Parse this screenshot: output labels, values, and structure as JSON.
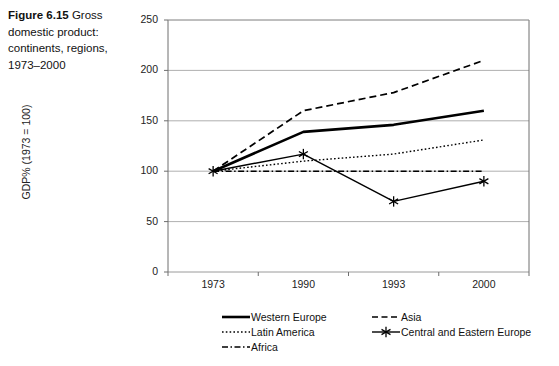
{
  "caption": {
    "label": "Figure 6.15",
    "text": " Gross domestic product: continents, regions, 1973–2000"
  },
  "chart_data": {
    "type": "line",
    "title": "",
    "xlabel": "",
    "ylabel": "GDP% (1973 = 100)",
    "categories": [
      "1973",
      "1990",
      "1993",
      "2000"
    ],
    "ylim": [
      0,
      250
    ],
    "yticks": [
      0,
      50,
      100,
      150,
      200,
      250
    ],
    "ytick_labels": [
      "0",
      "50",
      "100",
      "150",
      "200",
      "250"
    ],
    "grid": "horizontal",
    "legend_position": "below",
    "series": [
      {
        "name": "Western Europe",
        "values": [
          100,
          139,
          146,
          160
        ],
        "style": "solid-thick",
        "marker": "none",
        "color": "#000000"
      },
      {
        "name": "Asia",
        "values": [
          100,
          160,
          178,
          210
        ],
        "style": "dashed",
        "marker": "none",
        "color": "#000000"
      },
      {
        "name": "Latin America",
        "values": [
          100,
          110,
          117,
          131
        ],
        "style": "dotted",
        "marker": "none",
        "color": "#000000"
      },
      {
        "name": "Central and Eastern Europe",
        "values": [
          100,
          117,
          70,
          90
        ],
        "style": "solid",
        "marker": "asterisk",
        "color": "#000000"
      },
      {
        "name": "Africa",
        "values": [
          100,
          100,
          100,
          100
        ],
        "style": "dash-dot",
        "marker": "none",
        "color": "#000000"
      }
    ]
  },
  "legend": {
    "rows": [
      [
        {
          "name": "Western Europe",
          "key": "solid-thick"
        },
        {
          "name": "Asia",
          "key": "dashed"
        }
      ],
      [
        {
          "name": "Latin America",
          "key": "dotted"
        },
        {
          "name": "Central and Eastern Europe",
          "key": "asterisk-line"
        }
      ],
      [
        {
          "name": "Africa",
          "key": "dash-dot"
        }
      ]
    ]
  },
  "colors": {
    "ink": "#000000",
    "grid": "#9a9a9a",
    "axis": "#6e6e6e",
    "text": "#222222"
  }
}
